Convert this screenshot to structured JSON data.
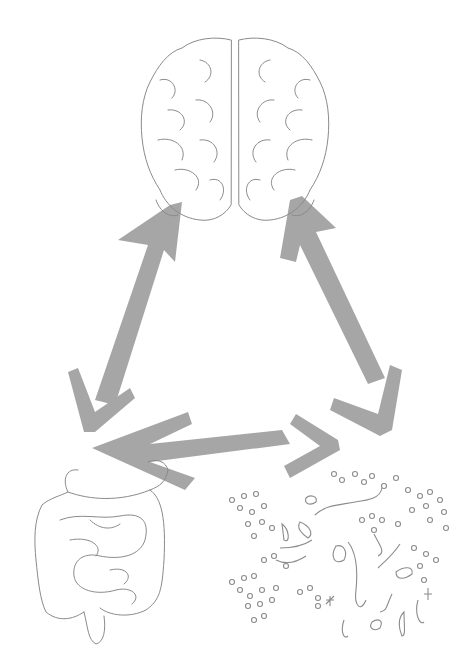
{
  "diagram": {
    "title": "",
    "nodes": [
      {
        "id": "brain",
        "label": "",
        "icon": "brain-icon"
      },
      {
        "id": "gut",
        "label": "",
        "icon": "intestines-icon"
      },
      {
        "id": "microbiome",
        "label": "",
        "icon": "bacteria-icon"
      }
    ],
    "edges": [
      {
        "from": "brain",
        "to": "gut",
        "direction": "bidirectional"
      },
      {
        "from": "brain",
        "to": "microbiome",
        "direction": "bidirectional"
      },
      {
        "from": "gut",
        "to": "microbiome",
        "direction": "bidirectional"
      }
    ],
    "colors": {
      "arrow": "#a6a6a6",
      "outline": "#8a8a8a",
      "background": "#ffffff"
    }
  }
}
